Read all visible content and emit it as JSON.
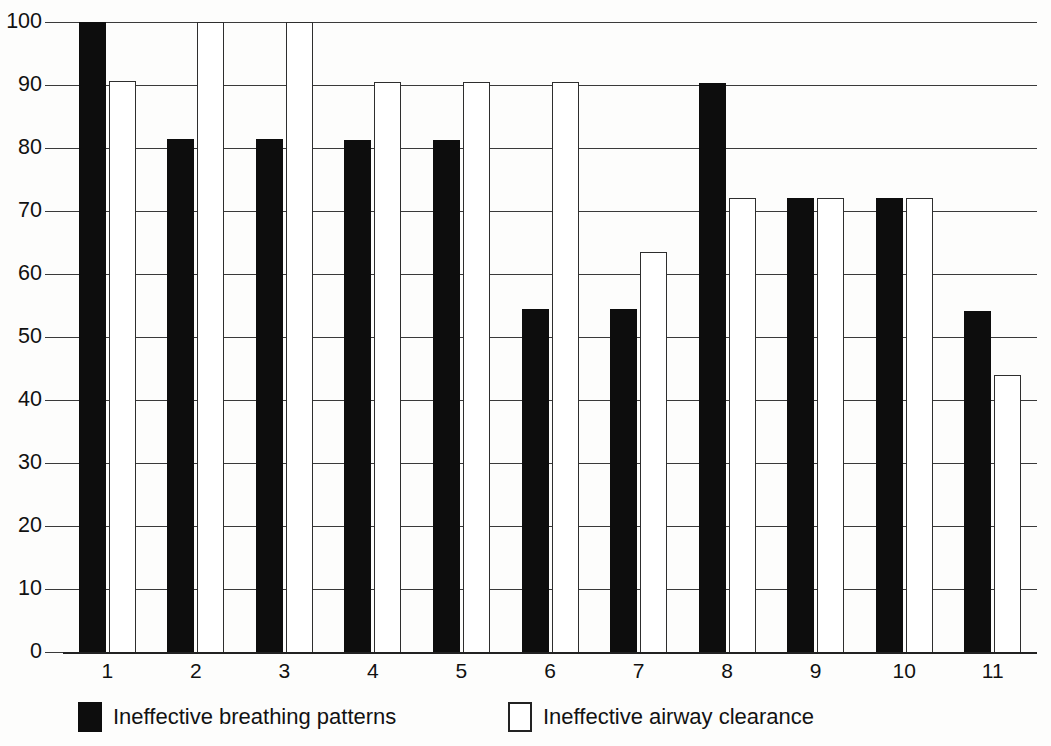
{
  "chart_data": {
    "type": "bar",
    "title": "",
    "subtitle": "",
    "xlabel": "",
    "ylabel": "",
    "ylim": [
      0,
      100
    ],
    "ytick_step": 10,
    "yticks": [
      0,
      10,
      20,
      30,
      40,
      50,
      60,
      70,
      80,
      90,
      100
    ],
    "ytick_labels": [
      "0",
      "10",
      "20",
      "30",
      "40",
      "50",
      "60",
      "70",
      "80",
      "90",
      "100"
    ],
    "grid": true,
    "grid_axis": "y",
    "legend_position": "bottom",
    "categories": [
      "1",
      "2",
      "3",
      "4",
      "5",
      "6",
      "7",
      "8",
      "9",
      "10",
      "11"
    ],
    "series": [
      {
        "name": "Ineffective breathing patterns",
        "color": "#0d0d0d",
        "style": "filled-black",
        "values": [
          100,
          81.4,
          81.4,
          81.2,
          81.2,
          54.5,
          54.4,
          90.3,
          72.1,
          72.0,
          54.1
        ]
      },
      {
        "name": "Ineffective airway clearance",
        "color": "#ffffff",
        "style": "outlined-white",
        "values": [
          90.7,
          100,
          100,
          90.5,
          90.4,
          90.4,
          63.5,
          72.1,
          72.1,
          72.0,
          44.0
        ]
      }
    ],
    "annotations": []
  },
  "legend": {
    "entries": [
      {
        "label": "Ineffective breathing patterns",
        "swatch": "black"
      },
      {
        "label": "Ineffective airway clearance",
        "swatch": "white"
      }
    ]
  },
  "colors": {
    "series_black": "#0d0d0d",
    "series_white": "#ffffff",
    "outline": "#2e2e2e",
    "gridline": "#3a3a3a",
    "axis": "#222222",
    "background": "#fdfdfc",
    "text": "#111111"
  }
}
